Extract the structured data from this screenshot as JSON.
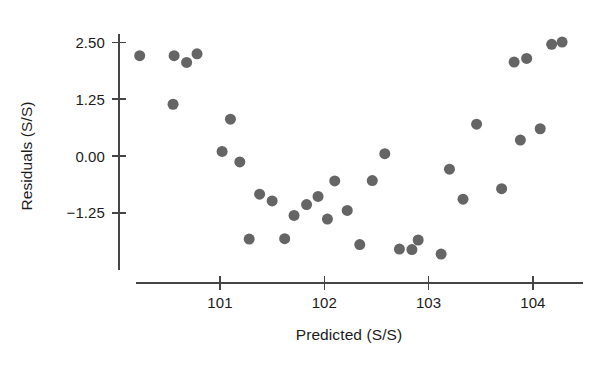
{
  "chart_data": {
    "type": "scatter",
    "title": "",
    "xlabel": "Predicted (S/S)",
    "ylabel": "Residuals (S/S)",
    "xlim": [
      100.18,
      104.38
    ],
    "ylim": [
      -2.55,
      2.95
    ],
    "xticks": [
      101,
      102,
      103,
      104
    ],
    "xtick_labels": [
      "101",
      "102",
      "103",
      "104"
    ],
    "yticks": [
      2.5,
      1.25,
      0.0,
      -1.25
    ],
    "ytick_labels": [
      "2.50",
      "1.25",
      "0.00",
      "-1.25"
    ],
    "grid": false,
    "legend": null,
    "marker": {
      "shape": "circle",
      "color": "#656565",
      "size_px": 11
    },
    "points": [
      {
        "x": 100.23,
        "y": 2.21
      },
      {
        "x": 100.55,
        "y": 1.14
      },
      {
        "x": 100.56,
        "y": 2.21
      },
      {
        "x": 100.68,
        "y": 2.06
      },
      {
        "x": 100.78,
        "y": 2.25
      },
      {
        "x": 101.02,
        "y": 0.1
      },
      {
        "x": 101.1,
        "y": 0.81
      },
      {
        "x": 101.19,
        "y": -0.13
      },
      {
        "x": 101.28,
        "y": -1.83
      },
      {
        "x": 101.38,
        "y": -0.84
      },
      {
        "x": 101.5,
        "y": -0.99
      },
      {
        "x": 101.62,
        "y": -1.82
      },
      {
        "x": 101.71,
        "y": -1.31
      },
      {
        "x": 101.83,
        "y": -1.07
      },
      {
        "x": 101.94,
        "y": -0.89
      },
      {
        "x": 102.03,
        "y": -1.39
      },
      {
        "x": 102.1,
        "y": -0.55
      },
      {
        "x": 102.22,
        "y": -1.2
      },
      {
        "x": 102.34,
        "y": -1.95
      },
      {
        "x": 102.46,
        "y": -0.54
      },
      {
        "x": 102.58,
        "y": 0.05
      },
      {
        "x": 102.72,
        "y": -2.05
      },
      {
        "x": 102.84,
        "y": -2.06
      },
      {
        "x": 102.9,
        "y": -1.85
      },
      {
        "x": 103.12,
        "y": -2.16
      },
      {
        "x": 103.2,
        "y": -0.29
      },
      {
        "x": 103.33,
        "y": -0.95
      },
      {
        "x": 103.46,
        "y": 0.7
      },
      {
        "x": 103.7,
        "y": -0.72
      },
      {
        "x": 103.82,
        "y": 2.07
      },
      {
        "x": 103.88,
        "y": 0.35
      },
      {
        "x": 103.94,
        "y": 2.15
      },
      {
        "x": 104.07,
        "y": 0.6
      },
      {
        "x": 104.18,
        "y": 2.46
      },
      {
        "x": 104.28,
        "y": 2.51
      }
    ]
  },
  "axes": {
    "y_axis_label": "Residuals (S/S)",
    "x_axis_label": "Predicted (S/S)"
  }
}
